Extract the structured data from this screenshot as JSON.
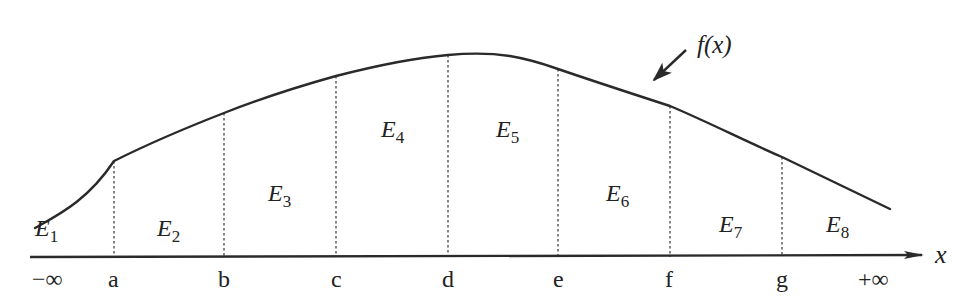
{
  "diagram": {
    "function_label": "f(x)",
    "axis": {
      "label": "x",
      "ticks": [
        {
          "label": "−∞",
          "x": 48
        },
        {
          "label": "a",
          "x": 114
        },
        {
          "label": "b",
          "x": 224
        },
        {
          "label": "c",
          "x": 336
        },
        {
          "label": "d",
          "x": 448
        },
        {
          "label": "e",
          "x": 558
        },
        {
          "label": "f",
          "x": 670
        },
        {
          "label": "g",
          "x": 782
        },
        {
          "label": "+∞",
          "x": 880
        }
      ]
    },
    "regions": [
      {
        "letter": "E",
        "sub": "1",
        "x": 35,
        "y": 236
      },
      {
        "letter": "E",
        "sub": "2",
        "x": 157,
        "y": 236
      },
      {
        "letter": "E",
        "sub": "3",
        "x": 268,
        "y": 201
      },
      {
        "letter": "E",
        "sub": "4",
        "x": 381,
        "y": 137
      },
      {
        "letter": "E",
        "sub": "5",
        "x": 496,
        "y": 137
      },
      {
        "letter": "E",
        "sub": "6",
        "x": 606,
        "y": 201
      },
      {
        "letter": "E",
        "sub": "7",
        "x": 719,
        "y": 232
      },
      {
        "letter": "E",
        "sub": "8",
        "x": 826,
        "y": 232
      }
    ],
    "colors": {
      "stroke": "#2a2a2a",
      "background": "#ffffff"
    }
  }
}
